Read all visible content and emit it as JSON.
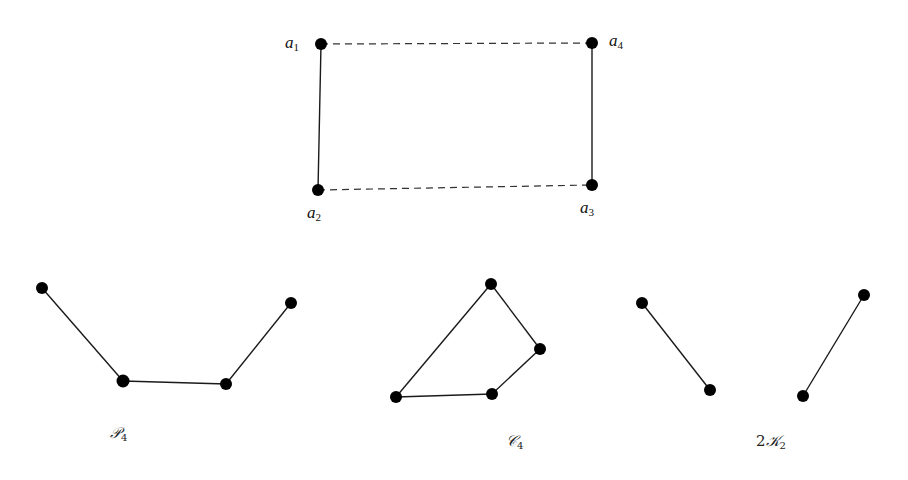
{
  "diagram": {
    "top_graph": {
      "vertices": [
        {
          "id": "a1",
          "label": "a",
          "sub": "1",
          "x": 321,
          "y": 44
        },
        {
          "id": "a2",
          "label": "a",
          "sub": "2",
          "x": 318,
          "y": 190
        },
        {
          "id": "a3",
          "label": "a",
          "sub": "3",
          "x": 592,
          "y": 185
        },
        {
          "id": "a4",
          "label": "a",
          "sub": "4",
          "x": 592,
          "y": 43
        }
      ],
      "solid_edges": [
        [
          "a1",
          "a2"
        ],
        [
          "a4",
          "a3"
        ]
      ],
      "dashed_edges": [
        [
          "a1",
          "a4"
        ],
        [
          "a2",
          "a3"
        ]
      ]
    },
    "p4": {
      "caption": "𝒫",
      "caption_sub": "4",
      "vertices": [
        [
          42,
          288
        ],
        [
          123,
          381
        ],
        [
          226,
          384
        ],
        [
          291,
          303
        ]
      ],
      "edges": [
        [
          0,
          1
        ],
        [
          1,
          2
        ],
        [
          2,
          3
        ]
      ]
    },
    "c4": {
      "caption": "𝒞",
      "caption_sub": "4",
      "vertices": [
        [
          491,
          284
        ],
        [
          540,
          349
        ],
        [
          492,
          394
        ],
        [
          396,
          397
        ]
      ],
      "edges": [
        [
          0,
          1
        ],
        [
          1,
          2
        ],
        [
          2,
          3
        ],
        [
          3,
          0
        ]
      ]
    },
    "two_k2": {
      "caption_prefix": "2",
      "caption": "𝒦",
      "caption_sub": "2",
      "vertices": [
        [
          642,
          303
        ],
        [
          710,
          390
        ],
        [
          864,
          295
        ],
        [
          803,
          396
        ]
      ],
      "edges": [
        [
          0,
          1
        ],
        [
          2,
          3
        ]
      ]
    }
  }
}
